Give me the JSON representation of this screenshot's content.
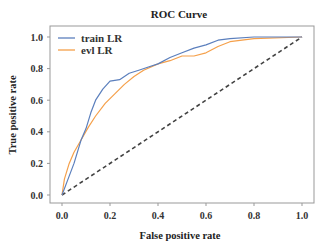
{
  "chart_data": {
    "type": "line",
    "title": "ROC Curve",
    "xlabel": "False positive rate",
    "ylabel": "True positive rate",
    "xlim": [
      0.0,
      1.0
    ],
    "ylim": [
      0.0,
      1.0
    ],
    "xticks": [
      "0.0",
      "0.2",
      "0.4",
      "0.6",
      "0.8",
      "1.0"
    ],
    "yticks": [
      "0.0",
      "0.2",
      "0.4",
      "0.6",
      "0.8",
      "1.0"
    ],
    "grid": false,
    "legend_position": "upper left",
    "series": [
      {
        "name": "train LR",
        "color": "#5b7fbd",
        "x": [
          0,
          0.02,
          0.05,
          0.08,
          0.1,
          0.12,
          0.14,
          0.17,
          0.2,
          0.24,
          0.28,
          0.32,
          0.36,
          0.4,
          0.45,
          0.5,
          0.55,
          0.6,
          0.65,
          0.7,
          0.8,
          1.0
        ],
        "y": [
          0,
          0.08,
          0.2,
          0.35,
          0.42,
          0.52,
          0.6,
          0.67,
          0.72,
          0.73,
          0.77,
          0.79,
          0.81,
          0.83,
          0.87,
          0.9,
          0.93,
          0.95,
          0.98,
          0.99,
          1.0,
          1.0
        ]
      },
      {
        "name": "evl LR",
        "color": "#f5a04a",
        "x": [
          0,
          0.01,
          0.03,
          0.05,
          0.08,
          0.11,
          0.14,
          0.18,
          0.22,
          0.26,
          0.3,
          0.34,
          0.4,
          0.45,
          0.5,
          0.55,
          0.6,
          0.65,
          0.7,
          0.8,
          1.0
        ],
        "y": [
          0,
          0.1,
          0.2,
          0.27,
          0.35,
          0.43,
          0.5,
          0.58,
          0.64,
          0.7,
          0.75,
          0.79,
          0.83,
          0.85,
          0.88,
          0.88,
          0.9,
          0.94,
          0.97,
          0.99,
          1.0
        ]
      },
      {
        "name": "chance",
        "color": "#444444",
        "style": "dashed",
        "x": [
          0,
          1
        ],
        "y": [
          0,
          1
        ]
      }
    ]
  }
}
